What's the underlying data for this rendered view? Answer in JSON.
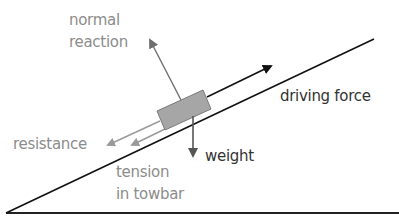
{
  "diagram": {
    "labels": {
      "normal_reaction_line1": "normal",
      "normal_reaction_line2": "reaction",
      "driving_force": "driving force",
      "resistance": "resistance",
      "weight": "weight",
      "tension_line1": "tension",
      "tension_line2": "in towbar"
    },
    "colors": {
      "dark": "#1a1a1a",
      "grey": "#8c8c8c",
      "box_fill": "#a6a6a6",
      "box_stroke": "#7a7a7a",
      "weight_arrow": "#555555",
      "normal_arrow": "#6e6e6e"
    }
  }
}
